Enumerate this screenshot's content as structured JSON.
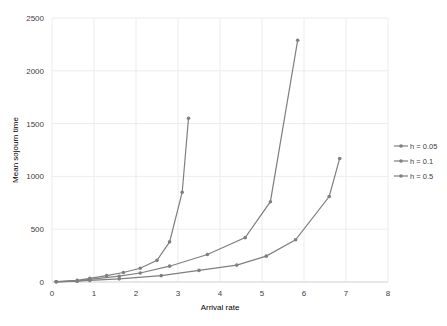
{
  "chart_data": {
    "type": "line",
    "title": "",
    "xlabel": "Arrival rate",
    "ylabel": "Mean sojourn time",
    "xlim": [
      0,
      8
    ],
    "ylim": [
      0,
      2500
    ],
    "xticks": [
      0,
      1,
      2,
      3,
      4,
      5,
      6,
      7,
      8
    ],
    "yticks": [
      0,
      500,
      1000,
      1500,
      2000,
      2500
    ],
    "grid": true,
    "legend_position": "right",
    "series": [
      {
        "name": "h = 0.05",
        "x": [
          0.1,
          0.6,
          0.9,
          1.6,
          2.6,
          3.5,
          4.4,
          5.1,
          5.8,
          6.6,
          6.85
        ],
        "y": [
          2,
          8,
          15,
          30,
          60,
          110,
          160,
          245,
          400,
          810,
          1170
        ]
      },
      {
        "name": "h = 0.1",
        "x": [
          0.1,
          0.6,
          0.9,
          1.6,
          2.1,
          2.8,
          3.7,
          4.6,
          5.2,
          5.85
        ],
        "y": [
          2,
          10,
          25,
          55,
          85,
          150,
          260,
          420,
          760,
          2290
        ]
      },
      {
        "name": "h = 0.5",
        "x": [
          0.1,
          0.6,
          0.9,
          1.3,
          1.7,
          2.1,
          2.5,
          2.8,
          3.1,
          3.25
        ],
        "y": [
          3,
          15,
          35,
          60,
          90,
          130,
          205,
          380,
          850,
          1550
        ]
      }
    ]
  },
  "legend": {
    "items": [
      "h = 0.05",
      "h = 0.1",
      "h = 0.5"
    ]
  },
  "axes": {
    "x_title": "Arrival rate",
    "y_title": "Mean sojourn time"
  },
  "colors": {
    "series_line": "#7f7f7f",
    "grid": "#ececec",
    "text": "#404040"
  }
}
